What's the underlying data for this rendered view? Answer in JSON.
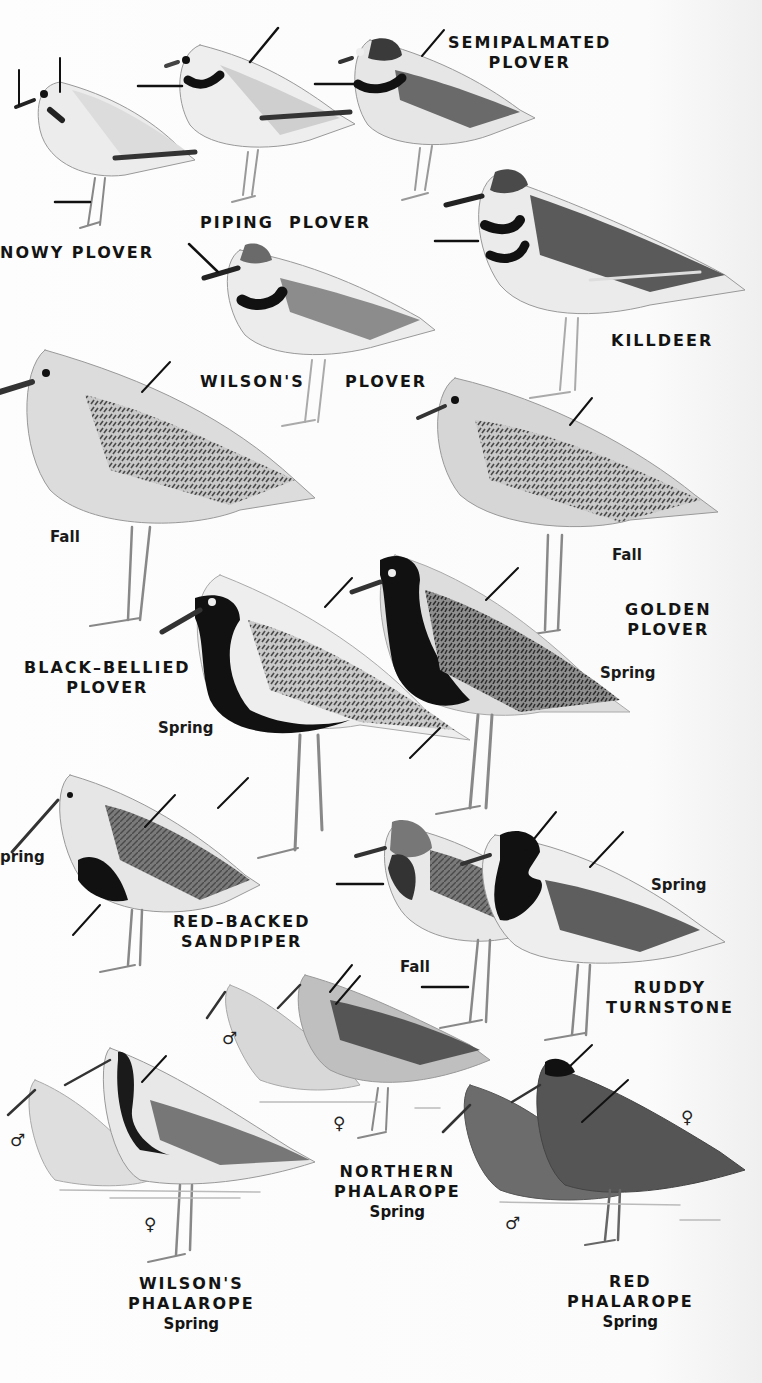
{
  "page": {
    "type": "field-guide-plate",
    "background": "#fbfbfb",
    "ink": "#141414"
  },
  "species": [
    {
      "id": "snowy-plover",
      "name_line1": "NOWY PLOVER",
      "name_line2": "",
      "note": "name cropped at left edge (SNOWY)"
    },
    {
      "id": "piping-plover",
      "name_line1": "PIPING  PLOVER",
      "name_line2": ""
    },
    {
      "id": "semipalmated-plover",
      "name_line1": "SEMIPALMATED",
      "name_line2": "PLOVER"
    },
    {
      "id": "killdeer",
      "name_line1": "KILLDEER",
      "name_line2": ""
    },
    {
      "id": "wilsons-plover",
      "name_line1": "WILSON'S",
      "name_line2": "PLOVER"
    },
    {
      "id": "black-bellied-plover",
      "name_line1": "BLACK–BELLIED",
      "name_line2": "PLOVER"
    },
    {
      "id": "golden-plover",
      "name_line1": "GOLDEN",
      "name_line2": "PLOVER"
    },
    {
      "id": "red-backed-sandpiper",
      "name_line1": "RED–BACKED",
      "name_line2": "SANDPIPER"
    },
    {
      "id": "ruddy-turnstone",
      "name_line1": "RUDDY",
      "name_line2": "TURNSTONE"
    },
    {
      "id": "northern-phalarope",
      "name_line1": "NORTHERN",
      "name_line2": "PHALAROPE",
      "season": "Spring"
    },
    {
      "id": "wilsons-phalarope",
      "name_line1": "WILSON'S",
      "name_line2": "PHALAROPE",
      "season": "Spring"
    },
    {
      "id": "red-phalarope",
      "name_line1": "RED",
      "name_line2": "PHALAROPE",
      "season": "Spring"
    }
  ],
  "seasons": {
    "bb_fall": "Fall",
    "bb_spring": "Spring",
    "golden_fall": "Fall",
    "golden_spring": "Spring",
    "rb_spring": "pring",
    "turnstone_fall": "Fall",
    "turnstone_spring": "Spring"
  },
  "sex_symbols": {
    "male": "♂",
    "female": "♀"
  }
}
